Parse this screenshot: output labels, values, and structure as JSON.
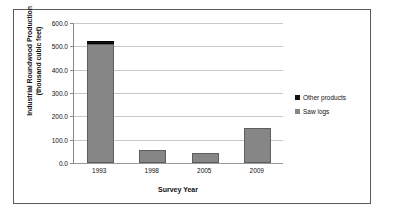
{
  "chart_data": {
    "type": "bar",
    "title": "",
    "subtitle": "",
    "xlabel": "Survey Year",
    "ylabel": "Industrial Roundwood Production (thousand cubic feet)",
    "ylabel_line1": "Industrial Roundwood Production",
    "ylabel_line2": "(thousand cubic feet)",
    "categories": [
      "1993",
      "1998",
      "2005",
      "2009"
    ],
    "stacked": true,
    "series": [
      {
        "name": "Saw logs",
        "color": "#868686",
        "values": [
          510,
          57,
          42,
          148
        ]
      },
      {
        "name": "Other products",
        "color": "#111111",
        "values": [
          12,
          0,
          0,
          0
        ]
      }
    ],
    "ylim": [
      0,
      600
    ],
    "ytick_labels": [
      "600.0",
      "500.0",
      "400.0",
      "300.0",
      "200.0",
      "100.0",
      "0.0"
    ],
    "ytick_values": [
      600,
      500,
      400,
      300,
      200,
      100,
      0
    ],
    "grid": true,
    "grid_axis": "y",
    "legend_position": "right",
    "legend_entries": [
      {
        "label": "Other products",
        "color": "#111111"
      },
      {
        "label": "Saw logs",
        "color": "#868686"
      }
    ]
  },
  "figure": {
    "border_color": "#5a5a5a",
    "background": "#ffffff",
    "gridline_color": "#c8c8c8",
    "axis_color": "#888888"
  }
}
